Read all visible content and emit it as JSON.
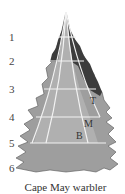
{
  "diagram": {
    "title": "Cape May warbler",
    "levels": [
      "1",
      "2",
      "3",
      "4",
      "5",
      "6"
    ],
    "level_y": [
      32,
      56,
      84,
      112,
      138,
      163
    ],
    "zones": [
      {
        "label": "T",
        "meaning": "tip",
        "x": 90,
        "y": 96
      },
      {
        "label": "M",
        "meaning": "middle",
        "x": 84,
        "y": 119
      },
      {
        "label": "B",
        "meaning": "base",
        "x": 76,
        "y": 131
      }
    ],
    "colors": {
      "dark_canopy": "#3c3c3c",
      "medium_canopy": "#9e9e9e",
      "divider_lines": "#f2f2f2",
      "text": "#333333"
    }
  }
}
